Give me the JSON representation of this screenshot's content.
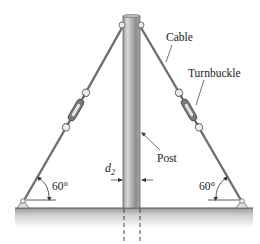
{
  "diagram": {
    "labels": {
      "cable": "Cable",
      "turnbuckle": "Turnbuckle",
      "post": "Post",
      "diameter_symbol": "d",
      "diameter_subscript": "2",
      "angle_left": "60°",
      "angle_right": "60°"
    },
    "colors": {
      "post_dark": "#8a8a8a",
      "post_light": "#d9d9d9",
      "cable": "#6e6e6e",
      "ground_top": "#9a9a9a",
      "ground_bottom": "#ffffff",
      "line": "#333333"
    },
    "components": [
      "post",
      "left-cable",
      "right-cable",
      "left-turnbuckle",
      "right-turnbuckle",
      "left-anchor",
      "right-anchor",
      "ground"
    ]
  }
}
